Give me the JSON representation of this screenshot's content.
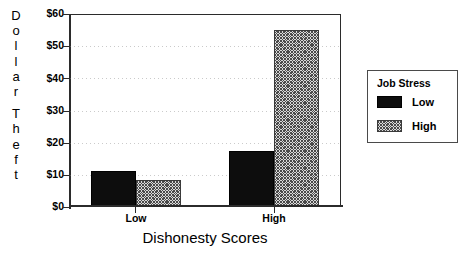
{
  "chart_data": {
    "type": "bar",
    "title": "",
    "xlabel": "Dishonesty Scores",
    "ylabel": "Dollar Theft",
    "categories": [
      "Low",
      "High"
    ],
    "series": [
      {
        "name": "Low",
        "values": [
          10.9,
          17.0
        ]
      },
      {
        "name": "High",
        "values": [
          8.1,
          54.6
        ]
      }
    ],
    "ylim": [
      0,
      60
    ],
    "yticks": [
      0,
      10,
      20,
      30,
      40,
      50,
      60
    ],
    "ytick_labels": [
      "$0",
      "$10",
      "$20",
      "$30",
      "$40",
      "$50",
      "$60"
    ],
    "grid": true,
    "grid_axis": "y",
    "legend_position": "right-outside",
    "legend_title": "Job Stress",
    "bar_styles": [
      "solid-black",
      "gray-crosshatch"
    ]
  },
  "axes": {
    "y_title_letters": [
      "D",
      "o",
      "l",
      "l",
      "a",
      "r",
      "",
      "T",
      "h",
      "e",
      "f",
      "t"
    ],
    "y_title_text": "Dollar Theft",
    "x_title_text": "Dishonesty Scores",
    "y_tick_labels": [
      "$60",
      "$50",
      "$40",
      "$30",
      "$20",
      "$10",
      "$0"
    ],
    "x_tick_labels": [
      "Low",
      "High"
    ]
  },
  "legend": {
    "title": "Job Stress",
    "entries": [
      {
        "label": "Low",
        "swatch": "solid-black"
      },
      {
        "label": "High",
        "swatch": "gray-crosshatch"
      }
    ]
  },
  "colors": {
    "series_low": "#0d0d0d",
    "series_high": "#d9d9d9",
    "axis": "#2b2b2b",
    "grid": "#828282",
    "background": "#ffffff"
  }
}
